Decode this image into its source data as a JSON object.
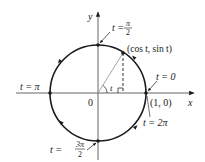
{
  "diagram": {
    "type": "unit-circle-parametrization",
    "axes": {
      "x_label": "x",
      "y_label": "y",
      "origin_label": "0"
    },
    "point": {
      "label": "(cos t, sin t)",
      "angle_label": "t"
    },
    "marked_points": [
      {
        "id": "t0",
        "label_t": "t = 0",
        "coord_label": "(1, 0)"
      },
      {
        "id": "t2pi",
        "label_t": "t = 2π"
      },
      {
        "id": "tpi2",
        "label_lhs": "t =",
        "num": "π",
        "den": "2"
      },
      {
        "id": "tpi",
        "label_t": "t = π"
      },
      {
        "id": "t3pi2",
        "label_lhs": "t =",
        "num": "3π",
        "den": "2"
      }
    ],
    "colors": {
      "stroke": "#1a1a1a",
      "axis": "#555555",
      "radius": "#9a9a9a",
      "background": "#ffffff"
    }
  }
}
